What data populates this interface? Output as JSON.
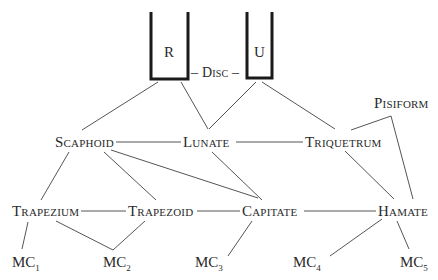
{
  "diagram": {
    "type": "wrist bone articulation diagram",
    "forearm": {
      "radius": {
        "label": "R"
      },
      "ulna": {
        "label": "U"
      },
      "disc": {
        "label": "– Disc –"
      }
    },
    "proximal_row": {
      "scaphoid": {
        "label": "Scaphoid"
      },
      "lunate": {
        "label": "Lunate"
      },
      "triquetrum": {
        "label": "Triquetrum"
      },
      "pisiform": {
        "label": "Pisiform"
      }
    },
    "distal_row": {
      "trapezium": {
        "label": "Trapezium"
      },
      "trapezoid": {
        "label": "Trapezoid"
      },
      "capitate": {
        "label": "Capitate"
      },
      "hamate": {
        "label": "Hamate"
      }
    },
    "metacarpals": [
      {
        "base": "MC",
        "sub": "1"
      },
      {
        "base": "MC",
        "sub": "2"
      },
      {
        "base": "MC",
        "sub": "3"
      },
      {
        "base": "MC",
        "sub": "4"
      },
      {
        "base": "MC",
        "sub": "5"
      }
    ],
    "connections": [
      [
        "R",
        "Scaphoid"
      ],
      [
        "R",
        "Lunate"
      ],
      [
        "U",
        "Lunate"
      ],
      [
        "U",
        "Triquetrum"
      ],
      [
        "Scaphoid",
        "Lunate"
      ],
      [
        "Lunate",
        "Triquetrum"
      ],
      [
        "Triquetrum",
        "Pisiform"
      ],
      [
        "Scaphoid",
        "Trapezium"
      ],
      [
        "Scaphoid",
        "Trapezoid"
      ],
      [
        "Scaphoid",
        "Capitate"
      ],
      [
        "Lunate",
        "Capitate"
      ],
      [
        "Triquetrum",
        "Hamate"
      ],
      [
        "Pisiform",
        "Hamate"
      ],
      [
        "Trapezium",
        "Trapezoid"
      ],
      [
        "Trapezoid",
        "Capitate"
      ],
      [
        "Capitate",
        "Hamate"
      ],
      [
        "Trapezium",
        "MC1"
      ],
      [
        "Trapezium",
        "MC2"
      ],
      [
        "Trapezoid",
        "MC2"
      ],
      [
        "Capitate",
        "MC3"
      ],
      [
        "Hamate",
        "MC4"
      ],
      [
        "Hamate",
        "MC5"
      ]
    ],
    "colors": {
      "ink": "#2a2a2a",
      "line": "#555555",
      "background": "#ffffff"
    }
  }
}
